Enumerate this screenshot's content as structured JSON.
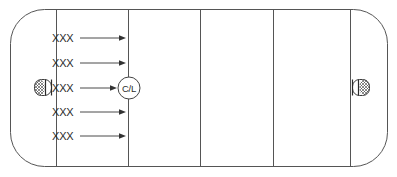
{
  "diagram": {
    "surface": {
      "name": "ice-rink",
      "outline_color": "#555555",
      "fill_color": "#ffffff",
      "corner_radius": 34,
      "left": 10,
      "top": 9,
      "width": 378,
      "height": 158
    },
    "zone_lines": [
      {
        "name": "goal-line-left",
        "x": 56
      },
      {
        "name": "blue-line-left",
        "x": 128
      },
      {
        "name": "center-line",
        "x": 200
      },
      {
        "name": "blue-line-right",
        "x": 273
      },
      {
        "name": "goal-line-right",
        "x": 350
      }
    ],
    "center_marker": {
      "label": "C/L",
      "cx": 129,
      "cy": 88,
      "r": 11,
      "color": "#2b2b2b"
    },
    "player_rows": [
      {
        "label": "XXX",
        "y": 38,
        "text_x": 52,
        "line_start": 80,
        "line_end": 124
      },
      {
        "label": "XXX",
        "y": 63,
        "text_x": 52,
        "line_start": 80,
        "line_end": 124
      },
      {
        "label": "XXX",
        "y": 88,
        "text_x": 52,
        "line_start": 80,
        "line_end": 117
      },
      {
        "label": "XXX",
        "y": 112,
        "text_x": 52,
        "line_start": 80,
        "line_end": 124
      },
      {
        "label": "XXX",
        "y": 136,
        "text_x": 52,
        "line_start": 80,
        "line_end": 124
      }
    ],
    "goals": [
      {
        "name": "goal-left",
        "x": 34,
        "y": 79,
        "width": 18,
        "height": 17,
        "facing": "right"
      },
      {
        "name": "goal-right",
        "x": 352,
        "y": 79,
        "width": 18,
        "height": 17,
        "facing": "left"
      }
    ],
    "colors": {
      "line": "#555555",
      "arrow": "#4a4a4a",
      "text": "#2b2b2b",
      "background": "#ffffff"
    }
  }
}
